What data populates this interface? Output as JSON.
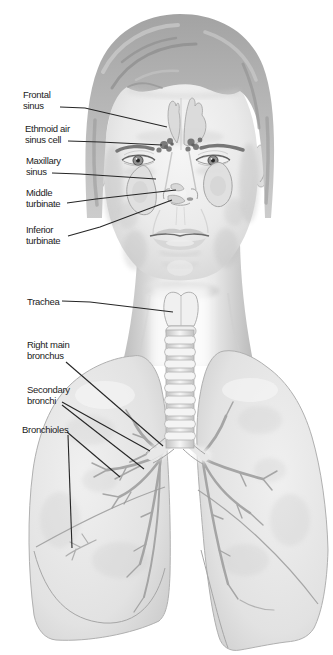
{
  "colors": {
    "background": "#ffffff",
    "label_text": "#1b1b1b",
    "leader_line": "#262626",
    "illustration_base_gray": "#e4e4e4"
  },
  "labels": [
    {
      "id": "frontal-sinus",
      "text": "Frontal\nsinus"
    },
    {
      "id": "ethmoid-air-sinus-cell",
      "text": "Ethmoid air\nsinus cell"
    },
    {
      "id": "maxillary-sinus",
      "text": "Maxillary\nsinus"
    },
    {
      "id": "middle-turbinate",
      "text": "Middle\nturbinate"
    },
    {
      "id": "inferior-turbinate",
      "text": "Inferior\nturbinate"
    },
    {
      "id": "trachea",
      "text": "Trachea"
    },
    {
      "id": "right-main-bronchus",
      "text": "Right main\nbronchus"
    },
    {
      "id": "secondary-bronchi",
      "text": "Secondary\nbronchi"
    },
    {
      "id": "bronchioles",
      "text": "Bronchioles"
    }
  ]
}
